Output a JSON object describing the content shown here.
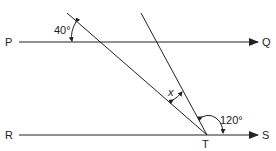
{
  "diagram": {
    "type": "geometry-parallel-lines",
    "points": {
      "P": "P",
      "Q": "Q",
      "R": "R",
      "S": "S",
      "T": "T"
    },
    "angles": {
      "top_left": "40°",
      "between_lines": "x",
      "bottom_right": "120°"
    },
    "colors": {
      "line": "#222222",
      "background": "#ffffff"
    }
  }
}
